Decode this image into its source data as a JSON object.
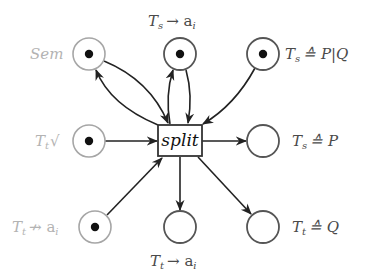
{
  "diagram": {
    "type": "petri-net",
    "transition": {
      "id": "split",
      "label": "split",
      "x": 158,
      "y": 125,
      "w": 44,
      "h": 31
    },
    "places": [
      {
        "id": "sem",
        "label": "Sem",
        "cx": 89,
        "cy": 54,
        "token": true,
        "faded_label": true,
        "faded_circle": true
      },
      {
        "id": "ts_ai",
        "label": "Tₛ → aᵢ",
        "cx": 180,
        "cy": 54,
        "token": true,
        "faded_label": false,
        "faded_circle": false
      },
      {
        "id": "ts_pq",
        "label": "Tₛ ≙ P|Q",
        "cx": 263,
        "cy": 54,
        "token": true,
        "faded_label": false,
        "faded_circle": false
      },
      {
        "id": "tt_tick",
        "label": "Tₜ √",
        "cx": 89,
        "cy": 141,
        "token": true,
        "faded_label": true,
        "faded_circle": true
      },
      {
        "id": "ts_p",
        "label": "Tₛ ≙ P",
        "cx": 263,
        "cy": 141,
        "token": false,
        "faded_label": false,
        "faded_circle": false
      },
      {
        "id": "tt_not_ai",
        "label": "Tₜ ↛ aᵢ",
        "cx": 95,
        "cy": 227,
        "token": true,
        "faded_label": true,
        "faded_circle": true
      },
      {
        "id": "tt_ai",
        "label": "Tₜ → aᵢ",
        "cx": 180,
        "cy": 227,
        "token": false,
        "faded_label": false,
        "faded_circle": false
      },
      {
        "id": "tt_q",
        "label": "Tₜ ≙ Q",
        "cx": 263,
        "cy": 227,
        "token": false,
        "faded_label": false,
        "faded_circle": false
      }
    ],
    "arcs": [
      {
        "from": "sem",
        "to": "split",
        "kind": "bidirectional-curved"
      },
      {
        "from": "ts_ai",
        "to": "split",
        "kind": "bidirectional-curved"
      },
      {
        "from": "ts_pq",
        "to": "split",
        "kind": "input"
      },
      {
        "from": "tt_tick",
        "to": "split",
        "kind": "input"
      },
      {
        "from": "tt_not_ai",
        "to": "split",
        "kind": "input"
      },
      {
        "from": "split",
        "to": "ts_p",
        "kind": "output"
      },
      {
        "from": "split",
        "to": "tt_ai",
        "kind": "output"
      },
      {
        "from": "split",
        "to": "tt_q",
        "kind": "output"
      }
    ]
  },
  "labels": {
    "split": "split",
    "sem": "Sem",
    "ts_ai_T": "T",
    "ts_ai_sub": "s",
    "ts_ai_rest": "→ a",
    "ts_ai_sub2": "i",
    "ts_pq_T": "T",
    "ts_pq_sub": "s",
    "ts_pq_rest": "≙ P|Q",
    "tt_tick_T": "T",
    "tt_tick_sub": "t",
    "tt_tick_rest": "√",
    "ts_p_T": "T",
    "ts_p_sub": "s",
    "ts_p_rest": "≙ P",
    "tt_not_ai_T": "T",
    "tt_not_ai_sub": "t",
    "tt_not_ai_rest": "↛ a",
    "tt_not_ai_sub2": "i",
    "tt_ai_T": "T",
    "tt_ai_sub": "t",
    "tt_ai_rest": "→ a",
    "tt_ai_sub2": "i",
    "tt_q_T": "T",
    "tt_q_sub": "t",
    "tt_q_rest": "≙ Q"
  }
}
